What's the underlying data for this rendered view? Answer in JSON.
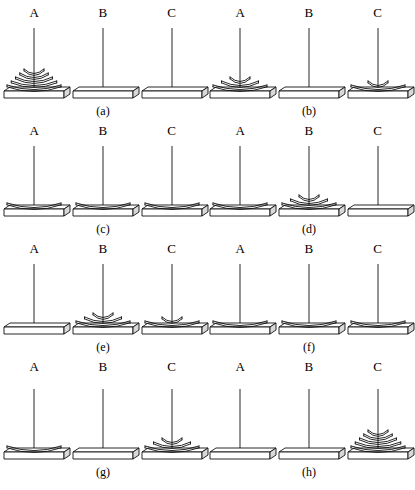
{
  "figure": {
    "peg_labels": [
      "A",
      "B",
      "C"
    ],
    "total_disks": 5,
    "panel_count": 8
  },
  "panels": [
    {
      "caption": "(a)",
      "pegs": [
        {
          "label": "A",
          "disks": 5
        },
        {
          "label": "B",
          "disks": 0
        },
        {
          "label": "C",
          "disks": 0
        }
      ]
    },
    {
      "caption": "(b)",
      "pegs": [
        {
          "label": "A",
          "disks": 3
        },
        {
          "label": "B",
          "disks": 0
        },
        {
          "label": "C",
          "disks": 2
        }
      ]
    },
    {
      "caption": "(c)",
      "pegs": [
        {
          "label": "A",
          "disks": 1
        },
        {
          "label": "B",
          "disks": 1
        },
        {
          "label": "C",
          "disks": 1
        }
      ]
    },
    {
      "caption": "(d)",
      "pegs": [
        {
          "label": "A",
          "disks": 1
        },
        {
          "label": "B",
          "disks": 3
        },
        {
          "label": "C",
          "disks": 0
        }
      ]
    },
    {
      "caption": "(e)",
      "pegs": [
        {
          "label": "A",
          "disks": 0
        },
        {
          "label": "B",
          "disks": 3
        },
        {
          "label": "C",
          "disks": 2
        }
      ]
    },
    {
      "caption": "(f)",
      "pegs": [
        {
          "label": "A",
          "disks": 1
        },
        {
          "label": "B",
          "disks": 1
        },
        {
          "label": "C",
          "disks": 1
        }
      ]
    },
    {
      "caption": "(g)",
      "pegs": [
        {
          "label": "A",
          "disks": 1
        },
        {
          "label": "B",
          "disks": 0
        },
        {
          "label": "C",
          "disks": 3
        }
      ]
    },
    {
      "caption": "(h)",
      "pegs": [
        {
          "label": "A",
          "disks": 0
        },
        {
          "label": "B",
          "disks": 0
        },
        {
          "label": "C",
          "disks": 5
        }
      ]
    }
  ],
  "colors": {
    "ink": "#111111",
    "paper": "#ffffff",
    "base_shade": "#d9d9d9"
  }
}
